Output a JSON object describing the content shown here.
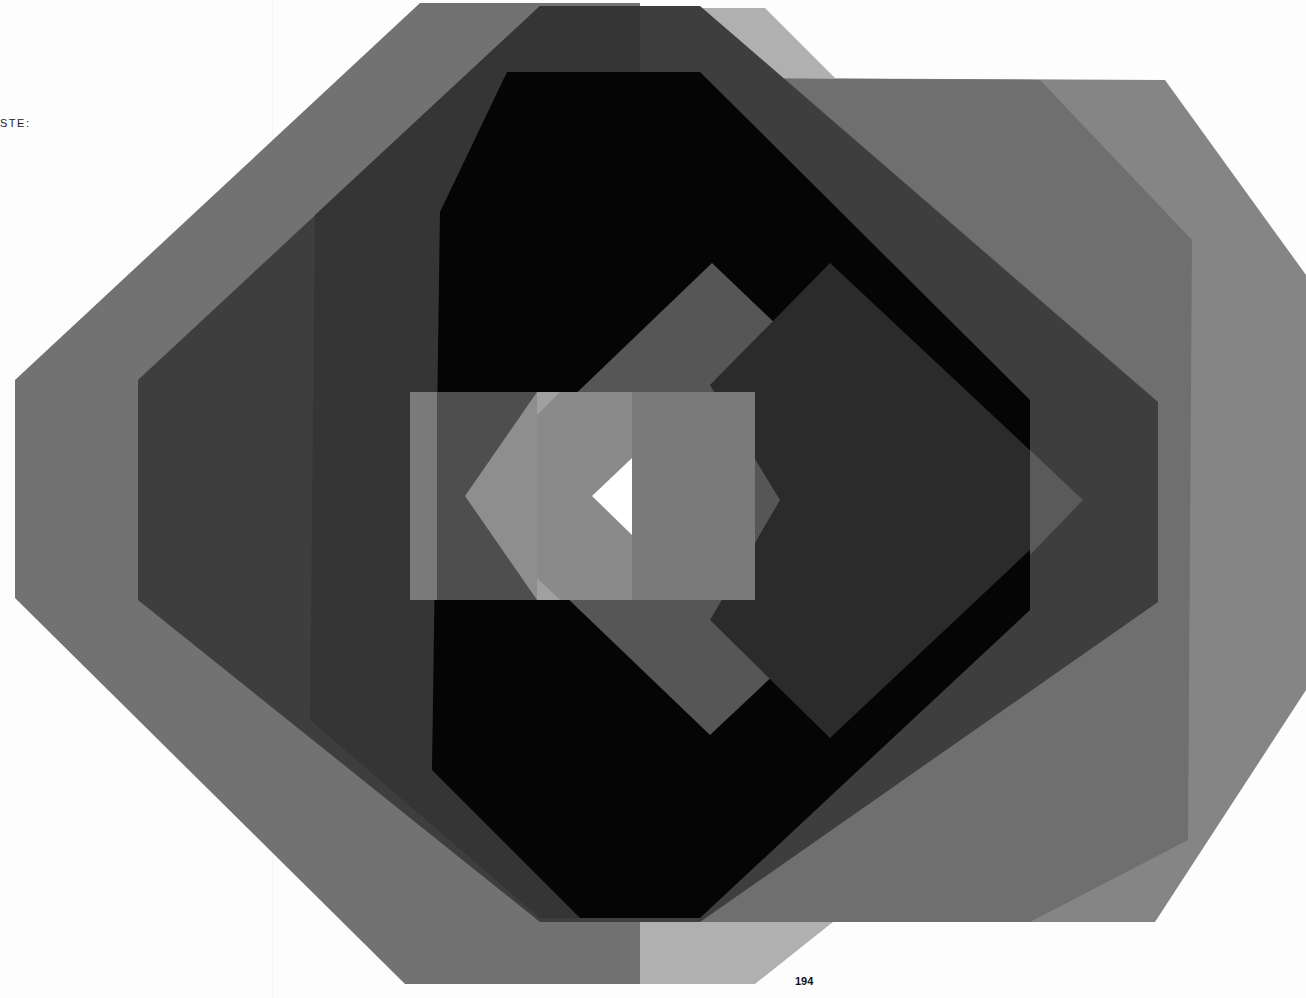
{
  "page": {
    "margin_text": "STE:",
    "page_number": "194"
  },
  "artwork": {
    "description": "Abstract composition of overlapping translucent octagons, squares and diamonds in grayscale with a small white triangle at the center",
    "palette": {
      "background": "#fdfdfd",
      "outer_gray": "#6e6e6e",
      "dark_gray": "#3c3c3c",
      "black": "#050505",
      "right_gray": "#7a7a7a",
      "light_gray": "#a8a8a8",
      "center_rect": "#7c7c7c",
      "center_light": "#9a9a9a",
      "diamond_mid": "#555555",
      "diamond_dark": "#2a2a2a",
      "white_triangle": "#ffffff"
    }
  }
}
